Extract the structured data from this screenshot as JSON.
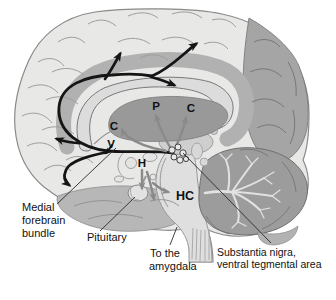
{
  "palette": {
    "background": "#ffffff",
    "cortex": "#e8e8e6",
    "outline": "#8a8a8a",
    "occipital": "#a5a5a5",
    "cerebellum": "#9c9c9c",
    "arbor_vitae": "#e2e2e2",
    "cingulate": "#b1b1b1",
    "corpus_callosum": "#dcdcdc",
    "striatum": "#999999",
    "temporal": "#b7b7b7",
    "brainstem": "#dfdfdf",
    "thalamus": "#cfcfcf",
    "pathway_black": "#151515",
    "pathway_gray": "#8a8a8a",
    "label_text": "#111111"
  },
  "labels": {
    "medial_forebrain_bundle": [
      "Medial",
      "forebrain",
      "bundle"
    ],
    "pituitary": "Pituitary",
    "to_the_amygdala": [
      "To the",
      "amygdala"
    ],
    "substantia_nigra_vta": [
      "Substantia nigra,",
      "ventral tegmental area"
    ]
  },
  "structure_letters": {
    "p": "P",
    "c_right": "C",
    "c_left": "C",
    "v": "V",
    "h": "H",
    "hc": "HC"
  }
}
